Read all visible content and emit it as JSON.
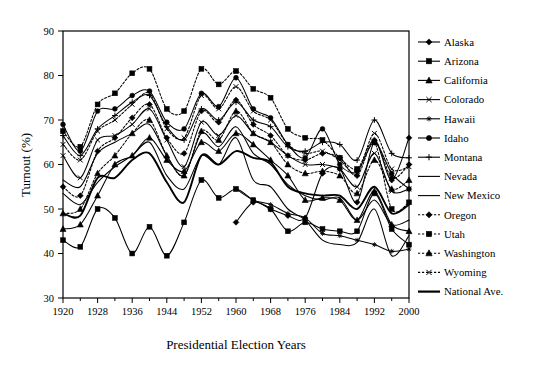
{
  "chart_data": {
    "type": "line",
    "title": "",
    "xlabel": "Presidential Election Years",
    "ylabel": "Turnout (%)",
    "xlim": [
      1920,
      2000
    ],
    "ylim": [
      30,
      90
    ],
    "grid": false,
    "legend_position": "right",
    "x_tick_labels": [
      "1920",
      "1928",
      "1936",
      "1944",
      "1952",
      "1960",
      "1968",
      "1976",
      "1984",
      "1992",
      "2000"
    ],
    "x_tick_values": [
      1920,
      1928,
      1936,
      1944,
      1952,
      1960,
      1968,
      1976,
      1984,
      1992,
      2000
    ],
    "x_minor_values": [
      1924,
      1932,
      1940,
      1948,
      1956,
      1964,
      1972,
      1980,
      1988,
      1996
    ],
    "y_tick_labels": [
      "30",
      "40",
      "50",
      "60",
      "70",
      "80",
      "90"
    ],
    "y_tick_values": [
      30,
      40,
      50,
      60,
      70,
      80,
      90
    ],
    "x": [
      1920,
      1924,
      1928,
      1932,
      1936,
      1940,
      1944,
      1948,
      1952,
      1956,
      1960,
      1964,
      1968,
      1972,
      1976,
      1980,
      1984,
      1988,
      1992,
      1996,
      2000
    ],
    "series": [
      {
        "name": "Alaska",
        "marker": "diamond",
        "dash": "solid",
        "width": "normal",
        "values": [
          null,
          null,
          null,
          null,
          null,
          null,
          null,
          null,
          null,
          null,
          47.0,
          51.5,
          50.0,
          48.5,
          48.0,
          58.0,
          59.0,
          51.5,
          65.0,
          56.5,
          66.0
        ]
      },
      {
        "name": "Arizona",
        "marker": "square",
        "dash": "solid",
        "width": "normal",
        "values": [
          43.0,
          41.5,
          50.0,
          48.0,
          40.0,
          46.0,
          39.5,
          47.0,
          56.5,
          52.5,
          54.5,
          52.0,
          50.0,
          45.0,
          47.0,
          45.5,
          45.0,
          45.0,
          53.5,
          45.5,
          42.0
        ]
      },
      {
        "name": "California",
        "marker": "triangle",
        "dash": "solid",
        "width": "normal",
        "values": [
          45.5,
          46.5,
          53.0,
          60.0,
          62.0,
          66.0,
          61.0,
          58.5,
          65.0,
          63.0,
          67.0,
          64.5,
          61.0,
          57.5,
          52.0,
          52.5,
          52.0,
          47.5,
          54.0,
          46.5,
          45.0
        ]
      },
      {
        "name": "Colorado",
        "marker": "x",
        "dash": "solid",
        "width": "normal",
        "values": [
          62.0,
          57.0,
          65.5,
          66.5,
          69.0,
          72.5,
          65.5,
          59.5,
          69.5,
          66.5,
          71.0,
          67.0,
          65.0,
          62.0,
          60.0,
          60.0,
          59.0,
          55.0,
          62.5,
          54.0,
          54.5
        ]
      },
      {
        "name": "Hawaii",
        "marker": "star",
        "dash": "solid",
        "width": "normal",
        "values": [
          null,
          null,
          null,
          null,
          null,
          null,
          null,
          null,
          null,
          null,
          54.5,
          52.0,
          51.0,
          49.0,
          48.0,
          44.5,
          44.0,
          43.0,
          42.0,
          40.5,
          41.0
        ]
      },
      {
        "name": "Idaho",
        "marker": "circle",
        "dash": "solid",
        "width": "normal",
        "values": [
          69.0,
          63.0,
          72.0,
          72.5,
          75.5,
          76.5,
          69.5,
          68.0,
          76.0,
          73.0,
          79.5,
          72.5,
          70.5,
          64.5,
          61.5,
          68.0,
          60.0,
          58.5,
          65.0,
          58.0,
          54.5
        ]
      },
      {
        "name": "Montana",
        "marker": "plus",
        "dash": "solid",
        "width": "normal",
        "values": [
          66.5,
          62.0,
          68.0,
          71.0,
          74.0,
          75.5,
          68.5,
          65.5,
          72.5,
          70.0,
          74.0,
          70.0,
          68.5,
          64.0,
          63.0,
          65.0,
          64.5,
          61.0,
          70.0,
          62.5,
          61.5
        ]
      },
      {
        "name": "Nevada",
        "marker": "none",
        "dash": "solid",
        "width": "normal",
        "values": [
          53.5,
          51.0,
          56.0,
          59.5,
          62.0,
          65.0,
          57.5,
          54.5,
          62.0,
          60.0,
          66.0,
          56.5,
          55.0,
          50.0,
          47.5,
          43.0,
          42.0,
          42.5,
          50.0,
          39.5,
          44.0
        ]
      },
      {
        "name": "New Mexico",
        "marker": "none",
        "dash": "solid",
        "width": "normal",
        "values": [
          56.5,
          55.0,
          62.5,
          65.0,
          67.0,
          69.0,
          62.0,
          57.5,
          67.0,
          64.0,
          68.5,
          62.5,
          60.0,
          55.5,
          53.0,
          52.0,
          52.5,
          47.5,
          52.0,
          46.5,
          47.5
        ]
      },
      {
        "name": "Oregon",
        "marker": "diamond",
        "dash": "dotted",
        "width": "normal",
        "values": [
          55.0,
          53.0,
          63.0,
          66.0,
          70.5,
          73.5,
          66.0,
          62.5,
          72.0,
          69.5,
          74.5,
          69.0,
          66.5,
          62.0,
          61.0,
          62.5,
          61.5,
          57.5,
          65.5,
          57.0,
          60.0
        ]
      },
      {
        "name": "Utah",
        "marker": "square",
        "dash": "dotted",
        "width": "normal",
        "values": [
          67.5,
          64.0,
          73.5,
          76.0,
          80.5,
          81.5,
          72.5,
          72.0,
          81.5,
          78.0,
          81.0,
          77.0,
          75.0,
          68.0,
          66.0,
          65.5,
          61.5,
          59.0,
          65.0,
          50.0,
          51.5
        ]
      },
      {
        "name": "Washington",
        "marker": "triangle",
        "dash": "dotted",
        "width": "normal",
        "values": [
          49.0,
          50.0,
          58.0,
          62.0,
          67.0,
          70.0,
          62.0,
          57.5,
          67.5,
          65.5,
          72.0,
          67.0,
          65.0,
          60.0,
          58.0,
          58.5,
          57.5,
          53.5,
          61.0,
          54.5,
          56.5
        ]
      },
      {
        "name": "Wyoming",
        "marker": "x",
        "dash": "dotted",
        "width": "normal",
        "values": [
          64.5,
          61.0,
          67.5,
          70.0,
          73.5,
          76.0,
          68.0,
          66.0,
          75.5,
          72.5,
          77.5,
          72.0,
          70.0,
          64.5,
          62.5,
          63.0,
          61.0,
          58.0,
          67.0,
          59.0,
          59.5
        ]
      },
      {
        "name": "National Ave.",
        "marker": "none",
        "dash": "solid",
        "width": "thick",
        "values": [
          49.0,
          48.5,
          57.0,
          57.0,
          61.0,
          62.5,
          56.0,
          51.5,
          62.0,
          60.0,
          63.0,
          61.5,
          60.5,
          55.0,
          53.5,
          53.0,
          53.0,
          50.0,
          55.0,
          49.0,
          51.0
        ]
      }
    ]
  }
}
